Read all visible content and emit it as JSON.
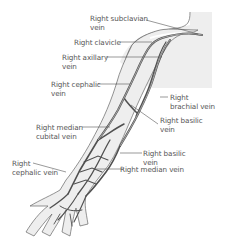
{
  "diagram": {
    "colors": {
      "vein": "#505050",
      "skin": "#eeeeee",
      "outline": "#666666",
      "leader": "#555555",
      "text": "#555555"
    },
    "labels": [
      {
        "id": "subclavian",
        "text": "Right subclavian\nvein"
      },
      {
        "id": "clavicle",
        "text": "Right clavicle"
      },
      {
        "id": "axillary",
        "text": "Right axillary\nvein"
      },
      {
        "id": "cephalic-upper",
        "text": "Right cephalic\nvein"
      },
      {
        "id": "brachial",
        "text": "Right\nbrachial vein"
      },
      {
        "id": "basilic-upper",
        "text": "Right basilic\nvein"
      },
      {
        "id": "median-cubital",
        "text": "Right median\ncubital vein"
      },
      {
        "id": "basilic-lower",
        "text": "Right basilic\nvein"
      },
      {
        "id": "cephalic-lower",
        "text": "Right\ncephalic vein"
      },
      {
        "id": "median",
        "text": "Right median vein"
      }
    ]
  }
}
